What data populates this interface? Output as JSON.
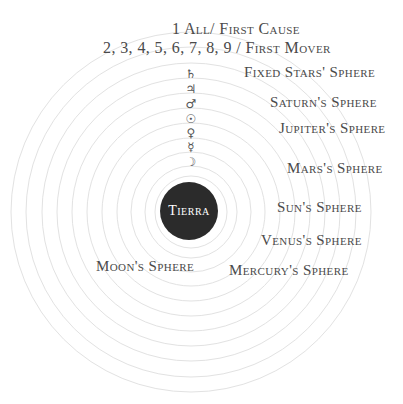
{
  "diagram": {
    "title_line1": "1 All/ First Cause",
    "title_line2": "2, 3, 4, 5, 6, 7, 8, 9 / First Mover",
    "center": {
      "label": "Tierra",
      "fill": "#2b2b2b"
    },
    "ring_color": "#e2e2e2",
    "symbols": [
      {
        "name": "saturn-symbol",
        "glyph": "♄"
      },
      {
        "name": "jupiter-symbol",
        "glyph": "♃"
      },
      {
        "name": "mars-symbol",
        "glyph": "♂"
      },
      {
        "name": "sun-symbol",
        "glyph": "☉"
      },
      {
        "name": "venus-symbol",
        "glyph": "♀"
      },
      {
        "name": "mercury-symbol",
        "glyph": "☿"
      },
      {
        "name": "moon-symbol",
        "glyph": "☽"
      }
    ],
    "spheres": [
      {
        "label": "Fixed Stars' Sphere"
      },
      {
        "label": "Saturn's Sphere"
      },
      {
        "label": "Jupiter's Sphere"
      },
      {
        "label": "Mars's Sphere"
      },
      {
        "label": "Sun's Sphere"
      },
      {
        "label": "Venus's Sphere"
      },
      {
        "label": "Mercury's Sphere"
      },
      {
        "label": "Moon's Sphere"
      }
    ],
    "text_color": "#4a4a4a"
  }
}
